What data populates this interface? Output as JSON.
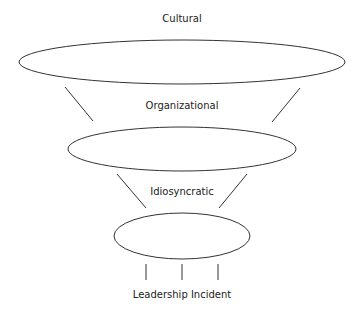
{
  "diagram": {
    "levels": [
      {
        "label": "Cultural"
      },
      {
        "label": "Organizational"
      },
      {
        "label": "Idiosyncratic"
      },
      {
        "label": "Leadership Incident"
      }
    ],
    "stroke_color": "#333333",
    "background": "#ffffff"
  }
}
